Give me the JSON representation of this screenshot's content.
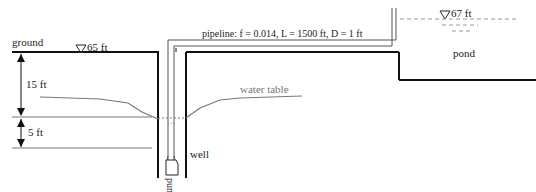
{
  "diagram": {
    "labels": {
      "ground": "ground",
      "ground_elevation": "65 ft",
      "pond_elevation": "67 ft",
      "pond": "pond",
      "pipeline": "pipeline: f = 0.014, L = 1500 ft, D = 1 ft",
      "water_table": "water table",
      "well": "well",
      "pump": "pump",
      "depth_upper": "15 ft",
      "depth_lower": "5 ft"
    },
    "icons": {
      "water_level_marker": "inverted-triangle"
    },
    "colors": {
      "structure": "#111111",
      "water_table": "#777777",
      "dimension": "#111111",
      "dashed_water": "#999999"
    }
  }
}
